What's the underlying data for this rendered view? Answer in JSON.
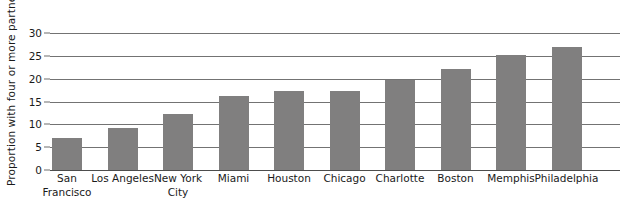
{
  "chart_data": {
    "type": "bar",
    "title": "",
    "xlabel": "",
    "ylabel": "Proportion with four or more partners",
    "ylim": [
      0,
      30
    ],
    "yticks": [
      0,
      5,
      10,
      15,
      20,
      25,
      30
    ],
    "ytick_labels": [
      "0",
      "5",
      "10",
      "15",
      "20",
      "25",
      "30"
    ],
    "grid": true,
    "legend": "none",
    "bar_color": "#807f7f",
    "categories": [
      "San Francisco",
      "Los Angeles",
      "New York City",
      "Miami",
      "Houston",
      "Chicago",
      "Charlotte",
      "Boston",
      "Memphis",
      "Philadelphia"
    ],
    "category_lines": [
      [
        "San",
        "Francisco"
      ],
      [
        "Los Angeles"
      ],
      [
        "New York",
        "City"
      ],
      [
        "Miami"
      ],
      [
        "Houston"
      ],
      [
        "Chicago"
      ],
      [
        "Charlotte"
      ],
      [
        "Boston"
      ],
      [
        "Memphis"
      ],
      [
        "Philadelphia"
      ]
    ],
    "values": [
      7,
      9.2,
      12.2,
      16.3,
      17.2,
      17.4,
      19.7,
      22.2,
      25.1,
      27
    ]
  }
}
